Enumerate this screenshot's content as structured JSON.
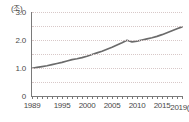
{
  "chart_data": {
    "type": "line",
    "title": "",
    "subtitle": "",
    "xlabel": "(년)",
    "ylabel": "(조)",
    "unit_label": "(조)",
    "x_unit_suffix": "(년)",
    "grid": true,
    "legend": null,
    "legend_position": "none",
    "line_color": "#6b6b6b",
    "grid_color": "#d8c8c8",
    "axis_color": "#7a7a7a",
    "text_color": "#4a4a4a",
    "xlim": [
      1989,
      2019
    ],
    "ylim": [
      0,
      3.0
    ],
    "y_ticks": [
      "3.0",
      "2.0",
      "1.0",
      "0"
    ],
    "y_tick_values": [
      3.0,
      2.0,
      1.0,
      0
    ],
    "y_gridline_values": [
      3.0,
      2.5,
      2.0,
      1.5,
      1.0,
      0.5
    ],
    "x_ticks": [
      "1989",
      "1995",
      "2000",
      "2005",
      "2010",
      "2015",
      "2019"
    ],
    "x_tick_values": [
      1989,
      1995,
      2000,
      2005,
      2010,
      2015,
      2019
    ],
    "x_last_label": "2019(년)",
    "x": [
      1989,
      1990,
      1991,
      1992,
      1993,
      1994,
      1995,
      1996,
      1997,
      1998,
      1999,
      2000,
      2001,
      2002,
      2003,
      2004,
      2005,
      2006,
      2007,
      2008,
      2009,
      2010,
      2011,
      2012,
      2013,
      2014,
      2015,
      2016,
      2017,
      2018,
      2019
    ],
    "values": [
      0.99,
      1.02,
      1.05,
      1.08,
      1.12,
      1.16,
      1.2,
      1.25,
      1.3,
      1.33,
      1.37,
      1.42,
      1.48,
      1.54,
      1.6,
      1.67,
      1.74,
      1.82,
      1.9,
      1.99,
      1.93,
      1.96,
      2.0,
      2.04,
      2.08,
      2.13,
      2.19,
      2.26,
      2.33,
      2.4,
      2.47
    ],
    "series": [
      {
        "name": "",
        "values": [
          0.99,
          1.02,
          1.05,
          1.08,
          1.12,
          1.16,
          1.2,
          1.25,
          1.3,
          1.33,
          1.37,
          1.42,
          1.48,
          1.54,
          1.6,
          1.67,
          1.74,
          1.82,
          1.9,
          1.99,
          1.93,
          1.96,
          2.0,
          2.04,
          2.08,
          2.13,
          2.19,
          2.26,
          2.33,
          2.4,
          2.47
        ]
      }
    ]
  }
}
